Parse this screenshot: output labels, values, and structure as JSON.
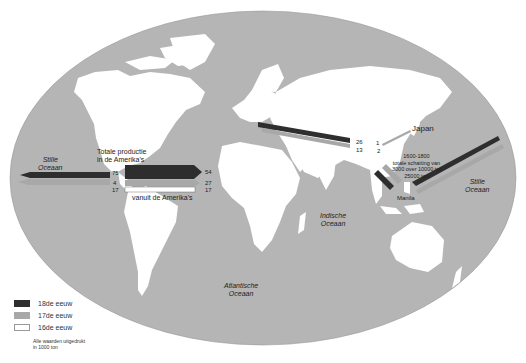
{
  "map": {
    "title": "",
    "colors": {
      "ocean": "#b5b5b5",
      "land": "#ffffff",
      "century_18": "#2e2e2e",
      "century_17": "#a8a8a8",
      "century_16": "#ffffff"
    },
    "labels": {
      "total_production_line1": "Totale productie",
      "total_production_line2": "in de Amerika's",
      "from_americas": "vanuit de Amerika's",
      "japan": "Japan",
      "manila": "Manila",
      "estimate_line1": "1600-1800",
      "estimate_line2": "totale schatting van",
      "estimate_line3": "3000 over 10000 tot",
      "estimate_line4": "25000 ton"
    },
    "oceans": {
      "pacific_west_line1": "Stille",
      "pacific_west_line2": "Oceaan",
      "pacific_east_line1": "Stille",
      "pacific_east_line2": "Oceaan",
      "indian_line1": "Indische",
      "indian_line2": "Oceaan",
      "atlantic_line1": "Atlantische",
      "atlantic_line2": "Oceaan"
    },
    "flows": {
      "americas_west": {
        "c18": "75",
        "c17": "4",
        "c16": "17"
      },
      "americas_east": {
        "c18": "54",
        "c17": "27",
        "c16": "17"
      },
      "europe_asia": {
        "c18": "26",
        "c17": "13"
      },
      "japan": {
        "c18": "1",
        "c17": "2"
      }
    }
  },
  "legend": {
    "items": [
      {
        "label": "18de eeuw",
        "color": "#2e2e2e"
      },
      {
        "label": "17de eeuw",
        "color": "#a8a8a8"
      },
      {
        "label": "16de eeuw",
        "color": "#ffffff"
      }
    ],
    "note_line1": "Alle waarden uitgedrukt",
    "note_line2": "in 1000 ton"
  }
}
